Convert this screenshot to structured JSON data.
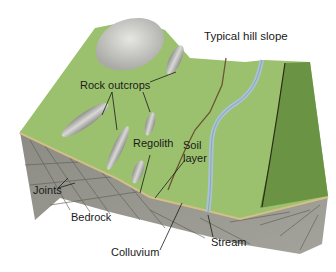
{
  "diagram": {
    "title": "Typical hill slope",
    "labels": {
      "rock_outcrops": "Rock outcrops",
      "regolith": "Regolith",
      "soil_layer_line1": "Soil",
      "soil_layer_line2": "layer",
      "joints": "Joints",
      "bedrock": "Bedrock",
      "colluvium": "Colluvium",
      "stream": "Stream"
    },
    "colors": {
      "grass_light": "#9cc16e",
      "grass_mid": "#86ae5a",
      "forest": "#5f8a3e",
      "rock": "#c9c9c6",
      "bedrock": "#9a9a92",
      "bedrock_dark": "#7d7d76",
      "soil_band": "#d4bf86",
      "stream": "#a9c3d6",
      "edge_line": "#5a4a2a",
      "leader": "#1a1a1a"
    }
  }
}
